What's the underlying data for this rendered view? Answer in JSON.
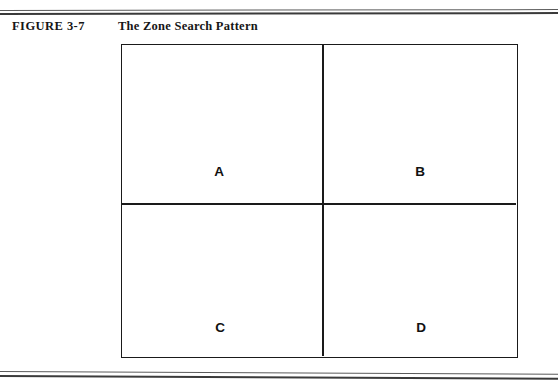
{
  "figure": {
    "label": "FIGURE 3-7",
    "title": "The Zone Search Pattern"
  },
  "diagram": {
    "type": "quadrant-grid",
    "rows": 2,
    "columns": 2,
    "zones": [
      {
        "id": "a",
        "label": "A",
        "position": "top-left"
      },
      {
        "id": "b",
        "label": "B",
        "position": "top-right"
      },
      {
        "id": "c",
        "label": "C",
        "position": "bottom-left"
      },
      {
        "id": "d",
        "label": "D",
        "position": "bottom-right"
      }
    ]
  },
  "colors": {
    "page_background": "#ffffff",
    "ink": "#161616",
    "rule": "#3a3a3a",
    "diagram_border": "#1a1a1a"
  }
}
